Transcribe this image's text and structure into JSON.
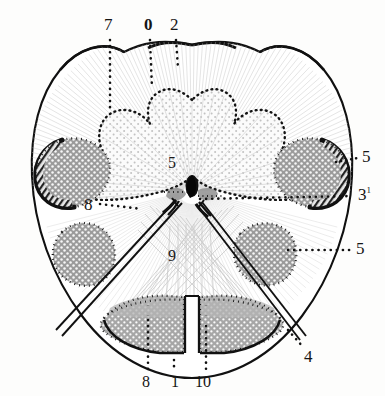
{
  "figure": {
    "kind": "anatomical-cross-section-illustration",
    "background_color": "#fdfdfc",
    "ink_color": "#151515",
    "stipple_gray": "#9a9a9a",
    "light_gray": "#c9c9c9"
  },
  "labels": {
    "top": [
      {
        "id": "top-7",
        "text": "7"
      },
      {
        "id": "top-0",
        "text": "0"
      },
      {
        "id": "top-2",
        "text": "2"
      }
    ],
    "right": [
      {
        "id": "right-5-upper",
        "text": "5"
      },
      {
        "id": "right-3-sup1",
        "text": "3",
        "superscript": "1"
      },
      {
        "id": "right-5-lower",
        "text": "5"
      }
    ],
    "left": [
      {
        "id": "left-8",
        "text": "8"
      }
    ],
    "interior": [
      {
        "id": "center-5",
        "text": "5"
      },
      {
        "id": "center-9",
        "text": "9"
      }
    ],
    "bottom": [
      {
        "id": "bottom-8",
        "text": "8"
      },
      {
        "id": "bottom-1",
        "text": "1"
      },
      {
        "id": "bottom-10",
        "text": "10"
      }
    ],
    "bottom_right": [
      {
        "id": "bottom-right-4",
        "text": "4"
      }
    ]
  },
  "icons": {
    "leader_line": "dotted-leader-line",
    "section_outline": "section-outline-path"
  }
}
